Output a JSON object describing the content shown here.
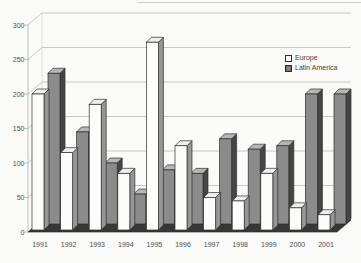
{
  "chart_data": {
    "type": "bar",
    "projection": "3d-column",
    "title": "",
    "xlabel": "",
    "ylabel": "",
    "categories": [
      "1991",
      "1992",
      "1993",
      "1994",
      "1995",
      "1996",
      "1997",
      "1998",
      "1999",
      "2000",
      "2001"
    ],
    "series": [
      {
        "name": "Europe",
        "color": "#fcfcfa",
        "values": [
          200,
          115,
          185,
          85,
          275,
          125,
          50,
          45,
          85,
          35,
          25
        ]
      },
      {
        "name": "Latin America",
        "color": "#8b8b8b",
        "values": [
          230,
          145,
          100,
          55,
          90,
          85,
          135,
          120,
          125,
          200,
          200
        ]
      }
    ],
    "ylim": [
      0,
      300
    ],
    "yticks": [
      0,
      50,
      100,
      150,
      200,
      250,
      300
    ],
    "grid": true,
    "legend_position": "right"
  },
  "colors": {
    "background": "#fafaf8",
    "grid": "#c2c2c2",
    "axis": "#b8b8b8",
    "label": "#4d4d4d",
    "floor": "#373737",
    "outline": "#2e2e2e",
    "europe_front": "#fcfcfa",
    "europe_top": "#eeeeec",
    "europe_side": "#969696",
    "latam_front": "#8b8b8b",
    "latam_top": "#b6b6b6",
    "latam_side": "#454545"
  }
}
